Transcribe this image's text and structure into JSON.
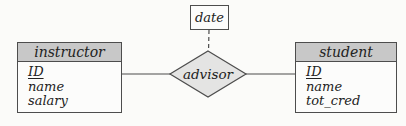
{
  "diagram": {
    "kind": "er-diagram",
    "entities": [
      {
        "name": "instructor",
        "attributes": [
          {
            "label": "ID",
            "primary_key": true
          },
          {
            "label": "name",
            "primary_key": false
          },
          {
            "label": "salary",
            "primary_key": false
          }
        ]
      },
      {
        "name": "student",
        "attributes": [
          {
            "label": "ID",
            "primary_key": true
          },
          {
            "label": "name",
            "primary_key": false
          },
          {
            "label": "tot_cred",
            "primary_key": false
          }
        ]
      }
    ],
    "relationship": {
      "name": "advisor",
      "connects": [
        "instructor",
        "student"
      ],
      "descriptive_attribute": "date",
      "attribute_link_style": "dashed"
    },
    "colors": {
      "entity_header_fill": "#c8c8c8",
      "diamond_fill": "#e4e4e3",
      "box_fill": "#fcfcfb",
      "line_stroke": "#4d4d4d",
      "background": "#fbfbf9",
      "text": "#222222"
    }
  }
}
